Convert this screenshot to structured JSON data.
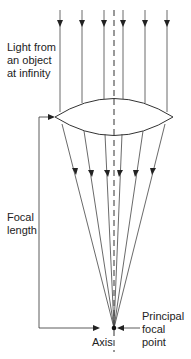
{
  "diagram": {
    "type": "optics-converging-lens",
    "labels": {
      "light_source": [
        "Light from",
        "an object",
        "at infinity"
      ],
      "focal_length": [
        "Focal",
        "length"
      ],
      "axis": "Axis",
      "principal_focal_point": [
        "Principal",
        "focal",
        "point"
      ]
    },
    "rays": {
      "count": 6,
      "x_positions": [
        60,
        82,
        104,
        123,
        145,
        167
      ]
    },
    "colors": {
      "line": "#333333",
      "axis": "#333333",
      "background": "#ffffff"
    }
  }
}
